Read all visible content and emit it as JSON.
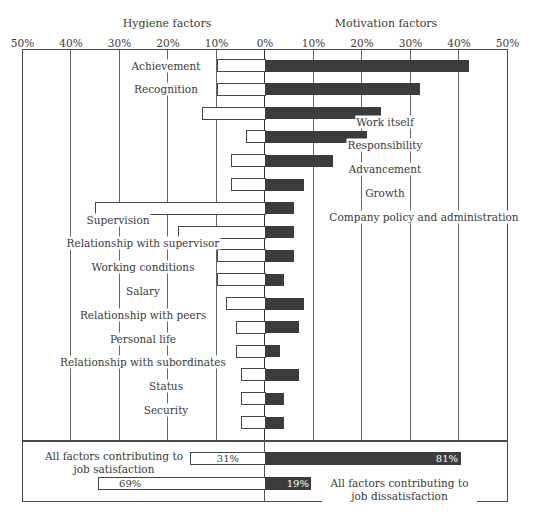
{
  "chart_data": {
    "type": "bar",
    "orientation": "horizontal-diverging",
    "title_left": "Hygiene factors",
    "title_right": "Motivation factors",
    "x_tick_labels": [
      "50%",
      "40%",
      "30%",
      "20%",
      "10%",
      "0%",
      "10%",
      "20%",
      "30%",
      "40%",
      "50%"
    ],
    "xlim": [
      -50,
      50
    ],
    "grid": true,
    "series": [
      {
        "name": "Leading to dissatisfaction (left, white bars)",
        "color": "#ffffff"
      },
      {
        "name": "Leading to satisfaction (right, dark bars)",
        "color": "#3c3c3c"
      }
    ],
    "categories": [
      "Achievement",
      "Recognition",
      "Work itself",
      "Responsibility",
      "Advancement",
      "Growth",
      "Company policy and administration",
      "Supervision",
      "Relationship with supervisor",
      "Working conditions",
      "Salary",
      "Relationship with peers",
      "Personal life",
      "Relationship with subordinates",
      "Status",
      "Security"
    ],
    "rows": [
      {
        "label": "Achievement",
        "group": "motivation",
        "left": 10,
        "right": 42
      },
      {
        "label": "Recognition",
        "group": "motivation",
        "left": 10,
        "right": 32
      },
      {
        "label": "Work itself",
        "group": "motivation",
        "left": 13,
        "right": 24
      },
      {
        "label": "Responsibility",
        "group": "motivation",
        "left": 4,
        "right": 21
      },
      {
        "label": "Advancement",
        "group": "motivation",
        "left": 7,
        "right": 14
      },
      {
        "label": "Growth",
        "group": "motivation",
        "left": 7,
        "right": 8
      },
      {
        "label": "Company policy and administration",
        "group": "motivation",
        "left": 35,
        "right": 6
      },
      {
        "label": "Supervision",
        "group": "hygiene",
        "left": 18,
        "right": 6
      },
      {
        "label": "Relationship with supervisor",
        "group": "hygiene",
        "left": 10,
        "right": 6
      },
      {
        "label": "Working conditions",
        "group": "hygiene",
        "left": 10,
        "right": 4
      },
      {
        "label": "Salary",
        "group": "hygiene",
        "left": 8,
        "right": 8
      },
      {
        "label": "Relationship with peers",
        "group": "hygiene",
        "left": 6,
        "right": 7
      },
      {
        "label": "Personal life",
        "group": "hygiene",
        "left": 6,
        "right": 3
      },
      {
        "label": "Relationship with subordinates",
        "group": "hygiene",
        "left": 5,
        "right": 7
      },
      {
        "label": "Status",
        "group": "hygiene",
        "left": 5,
        "right": 4
      },
      {
        "label": "Security",
        "group": "hygiene",
        "left": 5,
        "right": 4
      }
    ],
    "summary": [
      {
        "label": "All factors contributing to job satisfaction",
        "left": 31,
        "right": 81,
        "left_text": "31%",
        "right_text": "81%"
      },
      {
        "label": "All factors contributing to job dissatisfaction",
        "left": 69,
        "right": 19,
        "left_text": "69%",
        "right_text": "19%"
      }
    ]
  }
}
